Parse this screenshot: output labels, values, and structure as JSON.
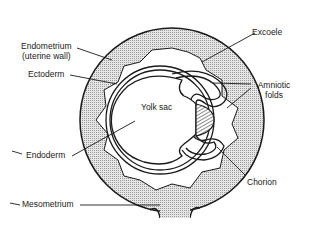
{
  "diagram": {
    "type": "anatomical cross-section",
    "labels": {
      "endometrium": "Endometrium",
      "endometrium_sub": "(uterine wall)",
      "ectoderm": "Ectoderm",
      "yolk_sac": "Yolk sac",
      "excoele": "Excoele",
      "amniotic_folds": "Amniotic",
      "amniotic_folds_sub": "folds",
      "endoderm": "Endoderm",
      "chorion": "Chorion",
      "mesometrium": "Mesometrium"
    },
    "colors": {
      "line": "#1a1a1a",
      "stipple": "#c8c8c8",
      "background": "#ffffff"
    }
  }
}
